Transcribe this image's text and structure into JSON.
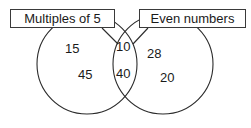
{
  "figure": {
    "type": "venn-diagram",
    "background_color": "#ffffff",
    "stroke_color": "#2b2b2b",
    "text_color": "#1a1a1a"
  },
  "sets": {
    "left": {
      "label": "Multiples of 5",
      "values": [
        "15",
        "45"
      ]
    },
    "right": {
      "label": "Even numbers",
      "values": [
        "28",
        "20"
      ]
    },
    "intersection": {
      "values": [
        "10",
        "40"
      ]
    }
  },
  "values": {
    "left_top": "15",
    "left_bottom": "45",
    "center_top": "10",
    "center_bottom": "40",
    "right_top": "28",
    "right_bottom": "20"
  }
}
